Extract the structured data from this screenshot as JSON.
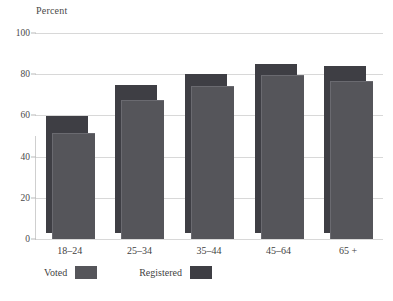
{
  "chart_data": {
    "type": "bar",
    "title": "",
    "subtitle": "",
    "xlabel": "",
    "ylabel": "Percent",
    "categories": [
      "18–24",
      "25–34",
      "35–44",
      "45–64",
      "65 +"
    ],
    "series": [
      {
        "name": "Registered",
        "values": [
          57,
          72,
          77,
          82,
          81
        ],
        "color": "#3e3e44"
      },
      {
        "name": "Voted",
        "values": [
          51,
          67,
          74,
          79,
          76
        ],
        "color": "#55555a"
      }
    ],
    "ylim": [
      0,
      100
    ],
    "yticks": [
      0,
      20,
      40,
      60,
      80,
      100
    ],
    "ytick_labels": [
      "0",
      "20",
      "40",
      "60",
      "80",
      "100"
    ],
    "grid": true,
    "legend_position": "bottom-left",
    "legend_entries": [
      "Voted",
      "Registered"
    ],
    "style": "overlapping-offset-pairs"
  },
  "axis": {
    "y_title": "Percent",
    "ticks": [
      "100",
      "80",
      "60",
      "40",
      "20",
      "0"
    ]
  },
  "legend": {
    "voted_label": "Voted",
    "registered_label": "Registered"
  },
  "colors": {
    "bar_front": "#55555a",
    "bar_back": "#3e3e44",
    "gridline": "#d8d8d8",
    "text": "#3a3a3a",
    "background": "#ffffff"
  }
}
